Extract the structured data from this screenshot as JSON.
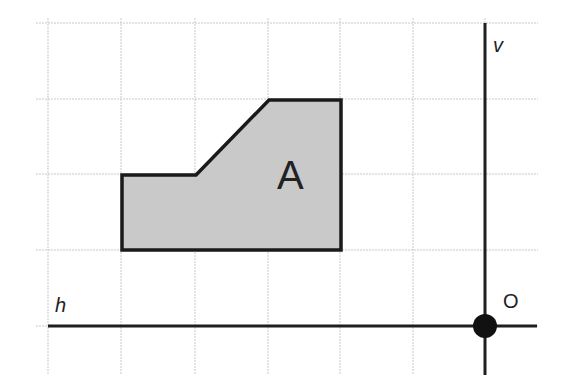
{
  "diagram": {
    "type": "coordinate-grid-with-shape",
    "grid": {
      "x_lines": [
        48,
        121,
        195,
        268,
        340,
        413,
        485
      ],
      "y_lines": [
        23,
        99,
        174,
        250,
        326
      ],
      "left": 36,
      "right": 538,
      "top": 18,
      "bottom": 375
    },
    "axes": {
      "horizontal": {
        "label": "h",
        "y": 326,
        "x_start": 48,
        "x_end": 537
      },
      "vertical": {
        "label": "v",
        "x": 485,
        "y_start": 23,
        "y_end": 375
      }
    },
    "origin": {
      "label": "O",
      "x": 485,
      "y": 326,
      "radius": 12
    },
    "shape": {
      "label": "A",
      "points": [
        [
          122,
          250
        ],
        [
          122,
          175
        ],
        [
          196,
          175
        ],
        [
          269,
          100
        ],
        [
          341,
          100
        ],
        [
          341,
          250
        ]
      ],
      "fill": "#c9c9c9",
      "stroke": "#1a1a1a"
    }
  }
}
